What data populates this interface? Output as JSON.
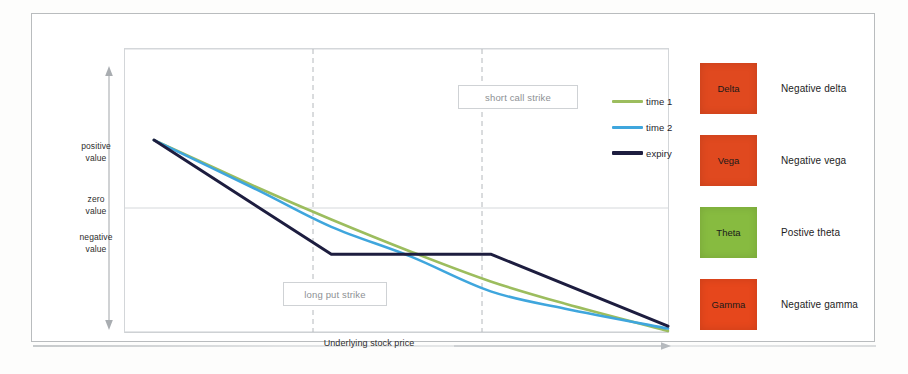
{
  "chart_data": {
    "type": "line",
    "title": "",
    "xlabel": "Underlying stock price",
    "ylabel": "",
    "grid": false,
    "legend_position": "top-right",
    "y_tick_labels": [
      "positive value",
      "zero value",
      "negative value"
    ],
    "annotations": [
      {
        "name": "short-call-strike",
        "label": "short call strike",
        "x": 0.655
      },
      {
        "name": "long-put-strike",
        "label": "long put strike",
        "x": 0.345
      }
    ],
    "axis_notes": {
      "y_axis_direction": "arrow up for positive value, arrow down for negative value",
      "x_axis_direction": "arrow right increasing underlying stock price"
    },
    "series": [
      {
        "name": "time 1",
        "color": "#9cbd5e",
        "points": [
          [
            0.0,
            0.79
          ],
          [
            0.2,
            0.6
          ],
          [
            0.345,
            0.47
          ],
          [
            0.5,
            0.34
          ],
          [
            0.655,
            0.22
          ],
          [
            0.8,
            0.13
          ],
          [
            1.0,
            0.02
          ]
        ]
      },
      {
        "name": "time 2",
        "color": "#3fa6dd",
        "points": [
          [
            0.0,
            0.79
          ],
          [
            0.2,
            0.59
          ],
          [
            0.345,
            0.44
          ],
          [
            0.5,
            0.32
          ],
          [
            0.655,
            0.18
          ],
          [
            0.8,
            0.11
          ],
          [
            1.0,
            0.03
          ]
        ]
      },
      {
        "name": "expiry",
        "color": "#1d1d3f",
        "points": [
          [
            0.0,
            0.79
          ],
          [
            0.345,
            0.33
          ],
          [
            0.655,
            0.33
          ],
          [
            1.0,
            0.04
          ]
        ]
      }
    ]
  },
  "legend": {
    "items": [
      {
        "label": "time 1",
        "color": "#9cbd5e"
      },
      {
        "label": "time 2",
        "color": "#3fa6dd"
      },
      {
        "label": "expiry",
        "color": "#1d1d3f"
      }
    ]
  },
  "axis_labels": {
    "positive_line1": "positive",
    "positive_line2": "value",
    "zero_line1": "zero",
    "zero_line2": "value",
    "negative_line1": "negative",
    "negative_line2": "value",
    "x_axis": "Underlying stock price"
  },
  "strikes": {
    "short_call": "short call strike",
    "long_put": "long put strike"
  },
  "greeks": {
    "rows": [
      {
        "name": "Delta",
        "description": "Negative delta",
        "color": "#e0491f"
      },
      {
        "name": "Vega",
        "description": "Negative vega",
        "color": "#e0491f"
      },
      {
        "name": "Theta",
        "description": "Postive theta",
        "color": "#87bb40"
      },
      {
        "name": "Gamma",
        "description": "Negative gamma",
        "color": "#e6471c"
      }
    ]
  }
}
